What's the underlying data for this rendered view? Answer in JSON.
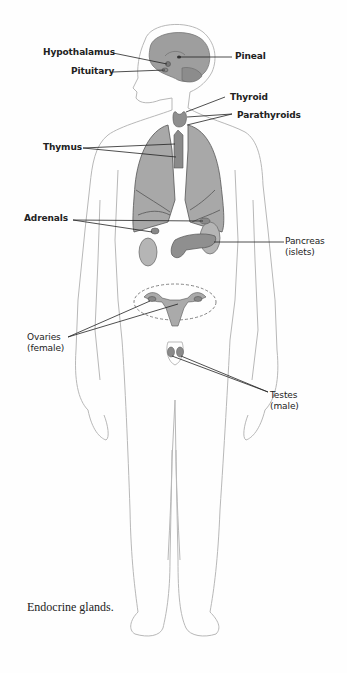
{
  "figure": {
    "caption": "Endocrine glands.",
    "colors": {
      "outline": "#b8b8b8",
      "organ_fill": "#9a9a9a",
      "organ_light": "#bdbdbd",
      "leader_line": "#222222",
      "background": "#fefefe"
    }
  },
  "labels": {
    "hypothalamus": "Hypothalamus",
    "pineal": "Pineal",
    "pituitary": "Pituitary",
    "thyroid": "Thyroid",
    "parathyroids": "Parathyroids",
    "thymus": "Thymus",
    "adrenals": "Adrenals",
    "pancreas": "Pancreas",
    "pancreas_sub": "(islets)",
    "ovaries": "Ovaries",
    "ovaries_sub": "(female)",
    "testes": "Testes",
    "testes_sub": "(male)"
  }
}
